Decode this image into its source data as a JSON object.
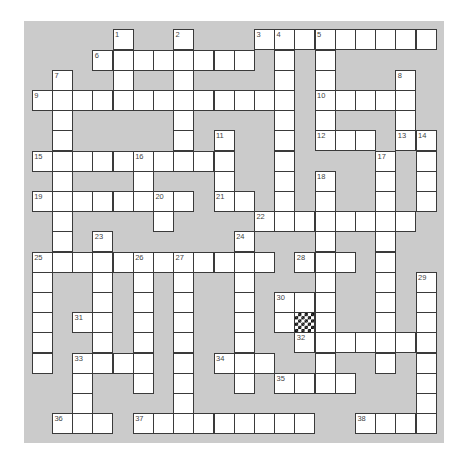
{
  "puzzle": {
    "type": "crossword",
    "rows": 20,
    "cols": 20,
    "colors": {
      "page_background": "#ffffff",
      "board_background": "#cbcbcb",
      "cell_fill": "#ffffff",
      "cell_border": "#3a3a3a",
      "number_color": "#444444",
      "checker_dark": "#111111"
    },
    "white_cells_by_row": [
      [
        4,
        7,
        11,
        12,
        13,
        14,
        15,
        16,
        17,
        18,
        19
      ],
      [
        3,
        4,
        5,
        6,
        7,
        8,
        9,
        10,
        12,
        14
      ],
      [
        1,
        4,
        7,
        12,
        14,
        18
      ],
      [
        0,
        1,
        2,
        3,
        4,
        5,
        6,
        7,
        8,
        9,
        10,
        11,
        12,
        14,
        15,
        16,
        17,
        18
      ],
      [
        1,
        7,
        12,
        14,
        18
      ],
      [
        1,
        7,
        9,
        12,
        14,
        15,
        16,
        18,
        19
      ],
      [
        0,
        1,
        2,
        3,
        4,
        5,
        6,
        7,
        8,
        9,
        12,
        17,
        19
      ],
      [
        1,
        5,
        9,
        12,
        14,
        17,
        19
      ],
      [
        0,
        1,
        2,
        3,
        4,
        5,
        6,
        7,
        9,
        10,
        12,
        14,
        17,
        19
      ],
      [
        1,
        6,
        11,
        12,
        13,
        14,
        15,
        16,
        17,
        18
      ],
      [
        1,
        3,
        10,
        14,
        17
      ],
      [
        0,
        1,
        2,
        3,
        4,
        5,
        6,
        7,
        8,
        9,
        10,
        11,
        13,
        14,
        15,
        17
      ],
      [
        0,
        3,
        5,
        7,
        10,
        14,
        17,
        19
      ],
      [
        0,
        3,
        5,
        7,
        10,
        12,
        13,
        14,
        17,
        19
      ],
      [
        0,
        2,
        3,
        5,
        7,
        10,
        12,
        13,
        14,
        17,
        19
      ],
      [
        0,
        3,
        5,
        7,
        10,
        13,
        14,
        15,
        16,
        17,
        18,
        19
      ],
      [
        0,
        2,
        3,
        4,
        5,
        7,
        9,
        10,
        11,
        14,
        17,
        19
      ],
      [
        2,
        5,
        7,
        10,
        12,
        13,
        14,
        15,
        19
      ],
      [
        2,
        7,
        19
      ],
      [
        1,
        2,
        3,
        5,
        6,
        7,
        8,
        9,
        10,
        11,
        12,
        13,
        16,
        17,
        18,
        19
      ]
    ],
    "special_cells": [
      {
        "row": 14,
        "col": 13,
        "style": "checkerboard"
      }
    ],
    "numbered_cells": [
      {
        "n": "1",
        "row": 0,
        "col": 4
      },
      {
        "n": "2",
        "row": 0,
        "col": 7
      },
      {
        "n": "3",
        "row": 0,
        "col": 11
      },
      {
        "n": "4",
        "row": 0,
        "col": 12
      },
      {
        "n": "5",
        "row": 0,
        "col": 14
      },
      {
        "n": "6",
        "row": 1,
        "col": 3
      },
      {
        "n": "7",
        "row": 2,
        "col": 1
      },
      {
        "n": "8",
        "row": 2,
        "col": 18
      },
      {
        "n": "9",
        "row": 3,
        "col": 0
      },
      {
        "n": "10",
        "row": 3,
        "col": 14
      },
      {
        "n": "11",
        "row": 5,
        "col": 9
      },
      {
        "n": "12",
        "row": 5,
        "col": 14
      },
      {
        "n": "13",
        "row": 5,
        "col": 18
      },
      {
        "n": "14",
        "row": 5,
        "col": 19
      },
      {
        "n": "15",
        "row": 6,
        "col": 0
      },
      {
        "n": "16",
        "row": 6,
        "col": 5
      },
      {
        "n": "17",
        "row": 6,
        "col": 17
      },
      {
        "n": "18",
        "row": 7,
        "col": 14
      },
      {
        "n": "19",
        "row": 8,
        "col": 0
      },
      {
        "n": "20",
        "row": 8,
        "col": 6
      },
      {
        "n": "21",
        "row": 8,
        "col": 9
      },
      {
        "n": "22",
        "row": 9,
        "col": 11
      },
      {
        "n": "23",
        "row": 10,
        "col": 3
      },
      {
        "n": "24",
        "row": 10,
        "col": 10
      },
      {
        "n": "25",
        "row": 11,
        "col": 0
      },
      {
        "n": "26",
        "row": 11,
        "col": 5
      },
      {
        "n": "27",
        "row": 11,
        "col": 7
      },
      {
        "n": "28",
        "row": 11,
        "col": 13
      },
      {
        "n": "29",
        "row": 12,
        "col": 19
      },
      {
        "n": "30",
        "row": 13,
        "col": 12
      },
      {
        "n": "31",
        "row": 14,
        "col": 2
      },
      {
        "n": "32",
        "row": 15,
        "col": 13
      },
      {
        "n": "33",
        "row": 16,
        "col": 2
      },
      {
        "n": "34",
        "row": 16,
        "col": 9
      },
      {
        "n": "35",
        "row": 17,
        "col": 12
      },
      {
        "n": "36",
        "row": 19,
        "col": 1
      },
      {
        "n": "37",
        "row": 19,
        "col": 5
      },
      {
        "n": "38",
        "row": 19,
        "col": 16
      }
    ],
    "entries": {
      "across": [
        {
          "n": "3",
          "row": 0,
          "col": 11,
          "length": 9
        },
        {
          "n": "6",
          "row": 1,
          "col": 3,
          "length": 8
        },
        {
          "n": "9",
          "row": 3,
          "col": 0,
          "length": 13
        },
        {
          "n": "10",
          "row": 3,
          "col": 14,
          "length": 5
        },
        {
          "n": "12",
          "row": 5,
          "col": 14,
          "length": 3
        },
        {
          "n": "13",
          "row": 5,
          "col": 18,
          "length": 2
        },
        {
          "n": "15",
          "row": 6,
          "col": 0,
          "length": 10
        },
        {
          "n": "19",
          "row": 8,
          "col": 0,
          "length": 8
        },
        {
          "n": "21",
          "row": 8,
          "col": 9,
          "length": 2
        },
        {
          "n": "22",
          "row": 9,
          "col": 11,
          "length": 8
        },
        {
          "n": "25",
          "row": 11,
          "col": 0,
          "length": 12
        },
        {
          "n": "28",
          "row": 11,
          "col": 13,
          "length": 3
        },
        {
          "n": "30",
          "row": 13,
          "col": 12,
          "length": 3
        },
        {
          "n": "31",
          "row": 14,
          "col": 2,
          "length": 2
        },
        {
          "n": "32",
          "row": 15,
          "col": 13,
          "length": 7
        },
        {
          "n": "33",
          "row": 16,
          "col": 2,
          "length": 4
        },
        {
          "n": "34",
          "row": 16,
          "col": 9,
          "length": 3
        },
        {
          "n": "35",
          "row": 17,
          "col": 12,
          "length": 4
        },
        {
          "n": "36",
          "row": 19,
          "col": 1,
          "length": 3
        },
        {
          "n": "37",
          "row": 19,
          "col": 5,
          "length": 9
        },
        {
          "n": "38",
          "row": 19,
          "col": 16,
          "length": 4
        }
      ],
      "down": [
        {
          "n": "1",
          "row": 0,
          "col": 4,
          "length": 4
        },
        {
          "n": "2",
          "row": 0,
          "col": 7,
          "length": 7
        },
        {
          "n": "4",
          "row": 0,
          "col": 12,
          "length": 10
        },
        {
          "n": "5",
          "row": 0,
          "col": 14,
          "length": 6
        },
        {
          "n": "7",
          "row": 2,
          "col": 1,
          "length": 10
        },
        {
          "n": "8",
          "row": 2,
          "col": 18,
          "length": 4
        },
        {
          "n": "11",
          "row": 5,
          "col": 9,
          "length": 4
        },
        {
          "n": "14",
          "row": 5,
          "col": 19,
          "length": 4
        },
        {
          "n": "16",
          "row": 6,
          "col": 5,
          "length": 3
        },
        {
          "n": "17",
          "row": 6,
          "col": 17,
          "length": 11
        },
        {
          "n": "18",
          "row": 7,
          "col": 14,
          "length": 11
        },
        {
          "n": "20",
          "row": 8,
          "col": 6,
          "length": 2
        },
        {
          "n": "23",
          "row": 10,
          "col": 3,
          "length": 7
        },
        {
          "n": "24",
          "row": 10,
          "col": 10,
          "length": 8
        },
        {
          "n": "25",
          "row": 11,
          "col": 0,
          "length": 6
        },
        {
          "n": "26",
          "row": 11,
          "col": 5,
          "length": 7
        },
        {
          "n": "27",
          "row": 11,
          "col": 7,
          "length": 9
        },
        {
          "n": "29",
          "row": 12,
          "col": 19,
          "length": 8
        },
        {
          "n": "30",
          "row": 13,
          "col": 12,
          "length": 2
        },
        {
          "n": "33",
          "row": 16,
          "col": 2,
          "length": 4
        }
      ]
    }
  }
}
